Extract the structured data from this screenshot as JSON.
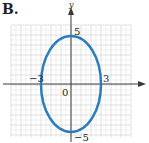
{
  "panel_label": "B.",
  "colors": {
    "curve": "#2b7bbf",
    "axis": "#3a3a3a",
    "grid_minor": "#e6e6e6",
    "grid_major": "#cfcfcf"
  },
  "chart_data": {
    "type": "line",
    "title": "",
    "subtitle": "Ellipse x^2/9 + y^2/25 = 1",
    "xlabel": "",
    "ylabel": "y",
    "xlim": [
      -6,
      6
    ],
    "ylim": [
      -6,
      6
    ],
    "grid": true,
    "legend": null,
    "series": [
      {
        "name": "ellipse",
        "shape": "ellipse",
        "center": [
          0,
          0
        ],
        "semi_axis_x": 3,
        "semi_axis_y": 5,
        "color": "#2b7bbf"
      }
    ],
    "annotations": [
      {
        "text": "5",
        "at": [
          0,
          5
        ]
      },
      {
        "text": "-5",
        "at": [
          0,
          -5
        ]
      },
      {
        "text": "3",
        "at": [
          3,
          0
        ]
      },
      {
        "text": "-3",
        "at": [
          -3,
          0
        ]
      },
      {
        "text": "0",
        "at": [
          0,
          0
        ]
      }
    ],
    "tick_labels": {
      "y_top": "5",
      "y_bottom": "−5",
      "x_right": "3",
      "x_left": "−3",
      "origin": "0"
    }
  }
}
